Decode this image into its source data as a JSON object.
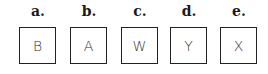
{
  "items": [
    {
      "label": "a.",
      "letter": "B"
    },
    {
      "label": "b.",
      "letter": "A"
    },
    {
      "label": "c.",
      "letter": "W"
    },
    {
      "label": "d.",
      "letter": "Y"
    },
    {
      "label": "e.",
      "letter": "X"
    }
  ]
}
